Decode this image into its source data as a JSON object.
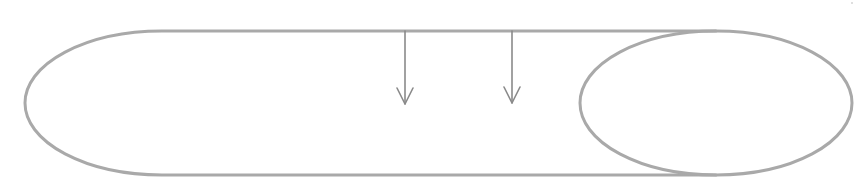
{
  "diagram": {
    "colors": {
      "background": "#ffffff",
      "shape_stroke": "#a9a9a9",
      "arrow_stroke": "#8a8a8a"
    },
    "stroke_widths": {
      "shape": 3,
      "arrow": 1.6
    },
    "outer_capsule": {
      "left_cap": {
        "cx": 162,
        "cy": 103,
        "rx": 137,
        "ry": 72
      },
      "top_y": 31,
      "bottom_y": 175,
      "right_x": 716
    },
    "inner_ellipse": {
      "cx": 716,
      "cy": 103,
      "rx": 136,
      "ry": 72
    },
    "arrows": [
      {
        "id": "arrow-1",
        "x": 405,
        "y_start": 31,
        "y_end": 104,
        "head_half_width": 8,
        "head_length": 16
      },
      {
        "id": "arrow-2",
        "x": 512,
        "y_start": 31,
        "y_end": 103,
        "head_half_width": 8,
        "head_length": 16
      }
    ],
    "labels": [],
    "corner_mark": {
      "x": 852,
      "y": 3,
      "visible": true
    }
  }
}
